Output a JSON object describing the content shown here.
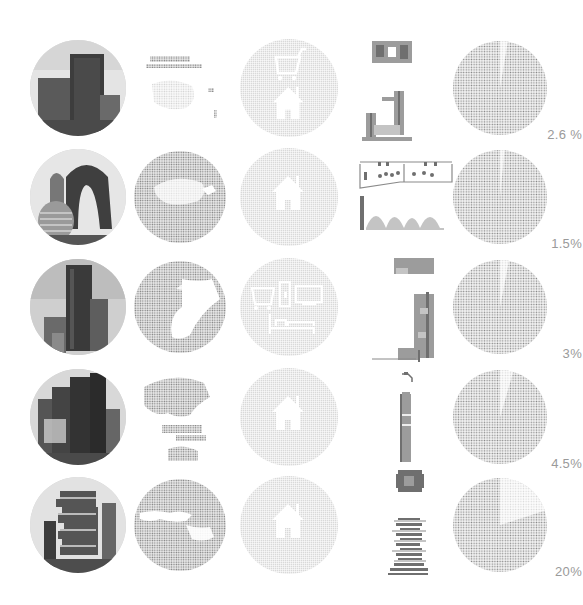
{
  "colors": {
    "background": "#ffffff",
    "dot_gray": "#8c8c8c",
    "icon_circle_gray": "#d9d9d9",
    "label_gray": "#9a9a9a",
    "building_dark": "#6f6f6f",
    "building_mid": "#9c9c9c",
    "building_light": "#c4c4c4"
  },
  "columns": [
    "photo",
    "globe-region",
    "function-icons",
    "building-drawing",
    "percentage-pie"
  ],
  "rows": [
    {
      "photo": "green-facade-tower",
      "region": "oceania-southeast-asia",
      "icons": [
        "shopping-cart-icon",
        "house-icon"
      ],
      "building": "tower-with-podium-plan-and-section",
      "percent_label": "2.6 %",
      "percent_value": 2.6
    },
    {
      "photo": "arched-hill-towers",
      "region": "east-asia",
      "icons": [
        "house-icon"
      ],
      "building": "wide-arched-complex-plan-and-elevation",
      "percent_label": "1.5%",
      "percent_value": 1.5
    },
    {
      "photo": "tall-commercial-tower",
      "region": "east-asia-pacific",
      "icons": [
        "shopping-cart-icon",
        "office-building-icon",
        "monitor-icon",
        "bed-icon"
      ],
      "building": "stepped-mixed-use-tower",
      "percent_label": "3%",
      "percent_value": 3
    },
    {
      "photo": "skyscraper-cluster",
      "region": "southeast-asia-australia",
      "icons": [
        "house-icon"
      ],
      "building": "slim-residential-tower",
      "percent_label": "4.5%",
      "percent_value": 4.5
    },
    {
      "photo": "stacked-boxes-tower",
      "region": "europe-middle-east",
      "icons": [
        "house-icon"
      ],
      "building": "stacked-slab-tower",
      "percent_label": "20%",
      "percent_value": 20
    }
  ],
  "chart_data": {
    "type": "pie",
    "title": "",
    "categories": [
      "Row 1",
      "Row 2",
      "Row 3",
      "Row 4",
      "Row 5"
    ],
    "values": [
      2.6,
      1.5,
      3,
      4.5,
      20
    ],
    "labels": [
      "2.6 %",
      "1.5%",
      "3%",
      "4.5%",
      "20%"
    ],
    "style": "dot-matrix pies, highlighted wedge starting at 12 o'clock"
  }
}
